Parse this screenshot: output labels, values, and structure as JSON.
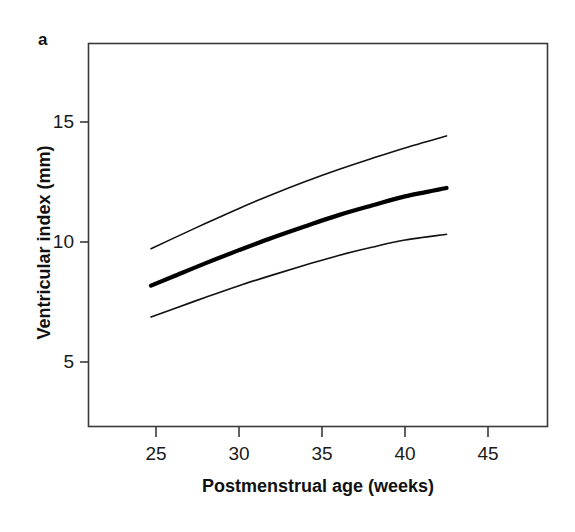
{
  "figure": {
    "panel_label": "a",
    "background_color": "#ffffff",
    "frame_color": "#3a3a3a"
  },
  "axis": {
    "y_title": "Ventricular index (mm)",
    "x_title": "Postmenstrual age (weeks)",
    "y_ticks": [
      "5",
      "10",
      "15"
    ],
    "x_ticks": [
      "25",
      "30",
      "35",
      "40",
      "45"
    ]
  },
  "chart_data": {
    "type": "line",
    "title": "",
    "subtitle": "",
    "xlabel": "Postmenstrual age (weeks)",
    "ylabel": "Ventricular index (mm)",
    "xlim": [
      21.5,
      49.0
    ],
    "ylim": [
      2.0,
      17.0
    ],
    "xticks": [
      25,
      30,
      35,
      40,
      45
    ],
    "yticks": [
      5,
      10,
      15
    ],
    "grid": false,
    "legend": null,
    "legend_position": "none",
    "annotations": [
      "a"
    ],
    "x": [
      24.7,
      26.0,
      28.0,
      30.0,
      32.0,
      34.0,
      36.0,
      38.0,
      40.0,
      42.5
    ],
    "series": [
      {
        "name": "upper-centile",
        "line_style": "thin",
        "color": "#111111",
        "width_px": 1.6,
        "values": [
          9.72,
          10.14,
          10.78,
          11.4,
          11.98,
          12.52,
          13.02,
          13.48,
          13.92,
          14.42
        ]
      },
      {
        "name": "median",
        "line_style": "thick",
        "color": "#000000",
        "width_px": 4.2,
        "values": [
          8.18,
          8.55,
          9.12,
          9.66,
          10.18,
          10.66,
          11.12,
          11.52,
          11.9,
          12.25
        ]
      },
      {
        "name": "lower-centile",
        "line_style": "thin",
        "color": "#111111",
        "width_px": 1.6,
        "values": [
          6.88,
          7.2,
          7.7,
          8.18,
          8.62,
          9.04,
          9.44,
          9.78,
          10.08,
          10.32
        ]
      }
    ]
  }
}
